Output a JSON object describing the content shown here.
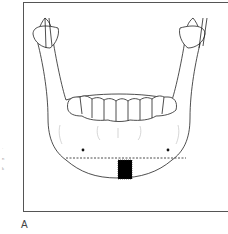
{
  "figure": {
    "panel_label": "A",
    "annotations": {
      "dashed_line": "horizontal osteotomy line",
      "black_block": "symphyseal graft site",
      "dots": 2
    }
  },
  "edge_fragments": [
    "·",
    "n",
    "k"
  ]
}
